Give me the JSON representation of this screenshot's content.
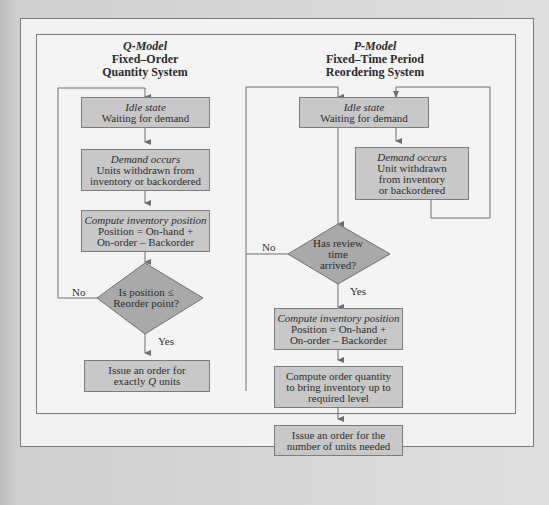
{
  "q_model": {
    "title": "Q-Model",
    "subtitle_1": "Fixed–Order",
    "subtitle_2": "Quantity System",
    "idle": {
      "title": "Idle state",
      "text": "Waiting for demand"
    },
    "demand": {
      "title": "Demand occurs",
      "line1": "Units withdrawn from",
      "line2": "inventory or backordered"
    },
    "compute": {
      "title": "Compute inventory position",
      "line1": "Position = On-hand +",
      "line2": "On-order – Backorder"
    },
    "decision": {
      "line1": "Is position ≤",
      "line2": "Reorder point?"
    },
    "no_label": "No",
    "yes_label": "Yes",
    "issue": {
      "line1": "Issue an order for",
      "line2_pre": "exactly ",
      "line2_q": "Q",
      "line2_post": " units"
    }
  },
  "p_model": {
    "title": "P-Model",
    "subtitle_1": "Fixed–Time Period",
    "subtitle_2": "Reordering System",
    "idle": {
      "title": "Idle state",
      "text": "Waiting for demand"
    },
    "demand": {
      "title": "Demand occurs",
      "line1": "Unit withdrawn",
      "line2": "from inventory",
      "line3": "or backordered"
    },
    "decision": {
      "line1": "Has review",
      "line2": "time",
      "line3": "arrived?"
    },
    "no_label": "No",
    "yes_label": "Yes",
    "compute": {
      "title": "Compute inventory position",
      "line1": "Position = On-hand +",
      "line2": "On-order – Backorder"
    },
    "order_qty": {
      "line1": "Compute order quantity",
      "line2": "to bring inventory up to",
      "line3": "required level"
    },
    "issue": {
      "line1": "Issue an order for the",
      "line2": "number of units needed"
    }
  },
  "colors": {
    "box_fill": "#c8c8c8",
    "diamond_fill": "#a9a9a9",
    "line": "#6e6e6e",
    "frame_bg": "#f2f2f2"
  }
}
